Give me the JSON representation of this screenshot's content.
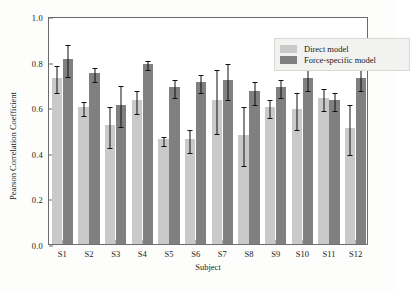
{
  "chart_data": {
    "type": "bar",
    "title": "",
    "xlabel": "Subject",
    "ylabel": "Pearson Correlation Coefficient",
    "categories": [
      "S1",
      "S2",
      "S3",
      "S4",
      "S5",
      "S6",
      "S7",
      "S8",
      "S9",
      "S10",
      "S11",
      "S12"
    ],
    "ylim": [
      0.0,
      1.0
    ],
    "yticks": [
      "0.0",
      "0.2",
      "0.4",
      "0.6",
      "0.8",
      "1.0"
    ],
    "ytick_values": [
      0.0,
      0.2,
      0.4,
      0.6,
      0.8,
      1.0
    ],
    "grid": false,
    "legend_position": "top-right",
    "series": [
      {
        "name": "Direct model",
        "color": "#c9c9c9",
        "values": [
          0.73,
          0.6,
          0.52,
          0.63,
          0.46,
          0.46,
          0.63,
          0.48,
          0.6,
          0.59,
          0.64,
          0.51
        ],
        "errors": [
          0.06,
          0.03,
          0.09,
          0.05,
          0.02,
          0.05,
          0.14,
          0.13,
          0.04,
          0.08,
          0.05,
          0.11
        ]
      },
      {
        "name": "Force-specific model",
        "color": "#808080",
        "values": [
          0.81,
          0.75,
          0.61,
          0.79,
          0.69,
          0.71,
          0.72,
          0.67,
          0.69,
          0.73,
          0.63,
          0.73
        ],
        "errors": [
          0.07,
          0.03,
          0.09,
          0.02,
          0.04,
          0.04,
          0.08,
          0.05,
          0.04,
          0.05,
          0.04,
          0.05
        ]
      }
    ]
  },
  "legend": {
    "items": [
      {
        "label": "Direct model",
        "swatch": "direct"
      },
      {
        "label": "Force-specific model",
        "swatch": "force"
      }
    ]
  }
}
